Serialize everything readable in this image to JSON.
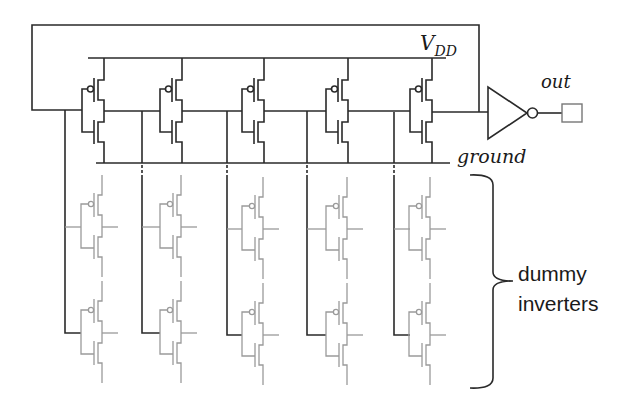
{
  "labels": {
    "vdd_main": "V",
    "vdd_sub": "DD",
    "ground": "ground",
    "out": "out",
    "dummy_line1": "dummy",
    "dummy_line2": "inverters"
  },
  "colors": {
    "wire": "#2a2a2a",
    "dummy": "#9a9a9a"
  },
  "ring_oscillator": {
    "stage_count": 5,
    "stage_rail_x": [
      104,
      182,
      264,
      348,
      432
    ],
    "input_bus_x": [
      65,
      142,
      227,
      307,
      394
    ],
    "dummy_rows_per_stage": 2
  },
  "components": [
    {
      "id": "stage-1",
      "type": "cmos-inverter"
    },
    {
      "id": "stage-2",
      "type": "cmos-inverter"
    },
    {
      "id": "stage-3",
      "type": "cmos-inverter"
    },
    {
      "id": "stage-4",
      "type": "cmos-inverter"
    },
    {
      "id": "stage-5",
      "type": "cmos-inverter"
    },
    {
      "id": "output-buffer",
      "type": "inverter-symbol"
    },
    {
      "id": "output-pad",
      "type": "pad"
    }
  ]
}
